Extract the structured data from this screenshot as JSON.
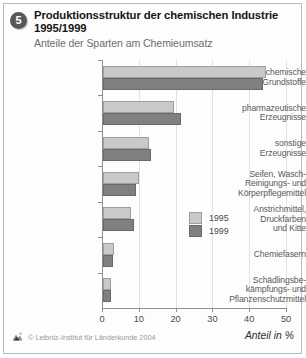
{
  "badge": {
    "number": "5"
  },
  "header": {
    "title": "Produktionsstruktur der chemischen Industrie 1995/1999",
    "subtitle": "Anteile der Sparten am Chemieumsatz"
  },
  "legend": {
    "items": [
      {
        "label": "1995",
        "color": "#c9c9c9"
      },
      {
        "label": "1999",
        "color": "#808080"
      }
    ]
  },
  "footer": {
    "axis_title": "Anteil in %",
    "credit": "© Leibniz-Institut für Länderkunde 2004"
  },
  "chart_data": {
    "type": "bar",
    "orientation": "horizontal",
    "title": "Produktionsstruktur der chemischen Industrie 1995/1999",
    "subtitle": "Anteile der Sparten am Chemieumsatz",
    "xlabel": "Anteil in %",
    "ylabel": "",
    "xlim": [
      0,
      50
    ],
    "xticks": [
      0,
      10,
      20,
      30,
      40,
      50
    ],
    "xticklabels": [
      "0",
      "10",
      "20",
      "30",
      "40",
      "50"
    ],
    "grid": true,
    "legend_position": "center-right",
    "categories": [
      "chemische Grundstoffe",
      "pharmazeutische Erzeugnisse",
      "sonstige Erzeugnisse",
      "Seifen, Wasch-, Reinigungs- und Körperpflegemittel",
      "Anstrichmittel, Druckfarben und Kitte",
      "Chemiefasern",
      "Schädlingsbekämpfungs- und Pflanzenschutzmittel"
    ],
    "category_lines": [
      [
        "chemische",
        "Grundstoffe"
      ],
      [
        "pharmazeutische",
        "Erzeugnisse"
      ],
      [
        "sonstige",
        "Erzeugnisse"
      ],
      [
        "Seifen, Wasch-",
        "Reinigungs- und",
        "Körperpflegemittel"
      ],
      [
        "Anstrichmittel,",
        "Druckfarben",
        "und Kitte"
      ],
      [
        "Chemiefasern"
      ],
      [
        "Schädlingsbe-",
        "kämpfungs- und",
        "Pflanzenschutzmittel"
      ]
    ],
    "series": [
      {
        "name": "1995",
        "color": "#c9c9c9",
        "values": [
          44.3,
          19.3,
          12.5,
          9.8,
          7.6,
          3.0,
          2.2
        ]
      },
      {
        "name": "1999",
        "color": "#808080",
        "values": [
          43.5,
          21.2,
          13.0,
          9.0,
          8.4,
          2.7,
          2.2
        ]
      }
    ]
  }
}
